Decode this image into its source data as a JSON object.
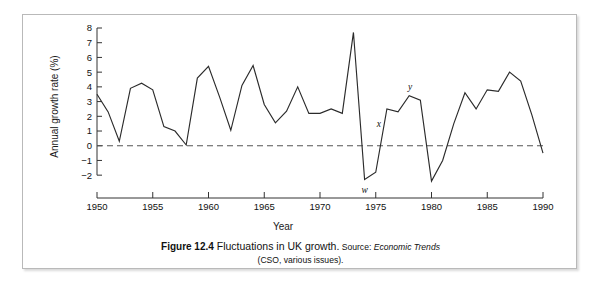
{
  "figure": {
    "caption_figure_number": "Figure 12.4",
    "caption_title": "Fluctuations in UK growth.",
    "caption_source_prefix": "Source:",
    "caption_source_italic": "Economic Trends",
    "caption_source_line2": "(CSO, various issues)."
  },
  "chart_data": {
    "type": "line",
    "title": "Fluctuations in UK growth",
    "xlabel": "Year",
    "ylabel": "Annual growth rate (%)",
    "xlim": [
      1950,
      1990
    ],
    "ylim": [
      -2.6,
      8.0
    ],
    "xticks": [
      1950,
      1955,
      1960,
      1965,
      1970,
      1975,
      1980,
      1985,
      1990
    ],
    "yticks": [
      -2,
      -1,
      0,
      1,
      2,
      3,
      4,
      5,
      6,
      7,
      8
    ],
    "grid": false,
    "legend": null,
    "zero_reference_line": 0,
    "x": [
      1950,
      1951,
      1952,
      1953,
      1954,
      1955,
      1956,
      1957,
      1958,
      1959,
      1960,
      1961,
      1962,
      1963,
      1964,
      1965,
      1966,
      1967,
      1968,
      1969,
      1970,
      1971,
      1972,
      1973,
      1974,
      1975,
      1976,
      1977,
      1978,
      1979,
      1980,
      1981,
      1982,
      1983,
      1984,
      1985,
      1986,
      1987,
      1988,
      1989,
      1990
    ],
    "values": [
      3.5,
      2.3,
      0.3,
      3.9,
      4.25,
      3.8,
      1.3,
      1.0,
      0.05,
      4.6,
      5.4,
      3.3,
      1.05,
      4.1,
      5.45,
      2.8,
      1.55,
      2.35,
      4.0,
      2.2,
      2.2,
      2.5,
      2.2,
      7.7,
      -2.3,
      -1.8,
      2.5,
      2.3,
      3.4,
      3.1,
      -2.4,
      -1.0,
      1.5,
      3.6,
      2.5,
      3.8,
      3.7,
      5.0,
      4.4,
      2.1,
      -0.5
    ],
    "annotations": [
      {
        "label": "w",
        "x": 1974,
        "y": -2.3
      },
      {
        "label": "x",
        "x": 1976,
        "y": 1.0
      },
      {
        "label": "y",
        "x": 1978,
        "y": 3.4
      }
    ],
    "series_color": "#2b2b2b"
  }
}
